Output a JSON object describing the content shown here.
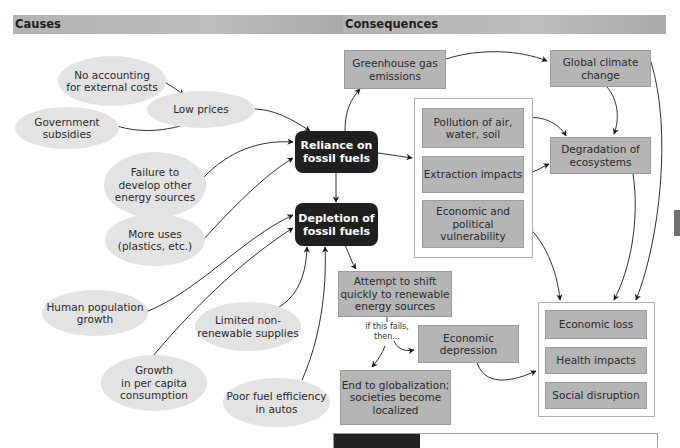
{
  "headers": {
    "causes": "Causes",
    "consequences": "Consequences"
  },
  "causes": {
    "no_accounting": "No accounting\nfor external costs",
    "government_subsidies": "Government\nsubsidies",
    "low_prices": "Low prices",
    "failure_to_develop": "Failure to\ndevelop other\nenergy sources",
    "more_uses": "More uses\n(plastics, etc.)",
    "human_population": "Human population\ngrowth",
    "limited_supplies": "Limited non-\nrenewable supplies",
    "per_capita_growth": "Growth\nin per capita\nconsumption",
    "poor_fuel_efficiency": "Poor fuel efficiency\nin autos"
  },
  "core": {
    "reliance": "Reliance on\nfossil fuels",
    "depletion": "Depletion of\nfossil fuels"
  },
  "consequences": {
    "greenhouse": "Greenhouse gas\nemissions",
    "global_climate": "Global climate\nchange",
    "pollution": "Pollution of air,\nwater, soil",
    "extraction": "Extraction impacts",
    "economic_political": "Economic and\npolitical vulnerability",
    "degradation": "Degradation of\necosystems",
    "attempt_shift": "Attempt to shift\nquickly to renewable\nenergy sources",
    "if_fails_note": "if this fails,\nthen...",
    "economic_depression": "Economic\ndepression",
    "end_globalization": "End to globalization;\nsocieties become\nlocalized",
    "economic_loss": "Economic loss",
    "health_impacts": "Health impacts",
    "social_disruption": "Social disruption"
  },
  "colors": {
    "header_bar": "#b3b3b3",
    "ellipse_fill": "#e3e3e3",
    "dark_box": "#1f1f1f",
    "consequence_box": "#b5b5b5",
    "arrow": "#1a1a1a"
  }
}
